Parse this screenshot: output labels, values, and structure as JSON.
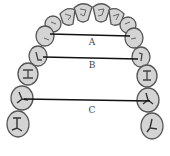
{
  "diagram": {
    "colors": {
      "tooth_fill": "#d4d4d4",
      "tooth_stroke": "#555555",
      "line": "#111111",
      "label": "#444444"
    },
    "measurements": [
      {
        "label": "A",
        "x1": 50,
        "y1": 34,
        "x2": 130,
        "y2": 36,
        "lx": 92,
        "ly": 45
      },
      {
        "label": "B",
        "x1": 43,
        "y1": 57,
        "x2": 138,
        "y2": 59,
        "lx": 92,
        "ly": 68
      },
      {
        "label": "C",
        "x1": 24,
        "y1": 99,
        "x2": 150,
        "y2": 101,
        "lx": 92,
        "ly": 113
      }
    ]
  }
}
